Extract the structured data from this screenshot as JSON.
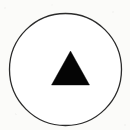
{
  "figure": {
    "kind": "glyph-icon",
    "title": "Triangle in circle symbol",
    "canvas": {
      "width": 130,
      "height": 130,
      "background_color": "#fbfbf9"
    },
    "shapes": {
      "circle": {
        "label": "outline circle",
        "center_x": 65.5,
        "center_y": 69.5,
        "radius": 56,
        "stroke_color": "#2b2b2b",
        "stroke_width": 1.3,
        "fill_color": "#ffffff"
      },
      "triangle": {
        "label": "solid upward triangle",
        "apex_x": 70.5,
        "apex_y": 51,
        "base_left_x": 51.5,
        "base_right_x": 89.5,
        "base_y": 85,
        "fill_color": "#050505",
        "points": "70.5,51 89.5,85 51.5,85"
      }
    }
  }
}
